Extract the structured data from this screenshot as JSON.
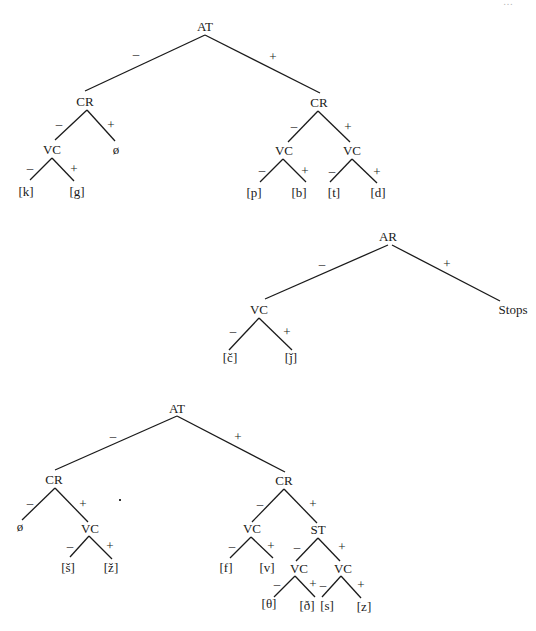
{
  "page_number_fragment": "…",
  "trees": [
    {
      "id": "tree-1",
      "root": {
        "label": "AT",
        "x": 205,
        "y": 31
      },
      "nodes": [
        {
          "id": "t1-at",
          "label": "AT",
          "x": 205,
          "y": 31
        },
        {
          "id": "t1-cr-minus",
          "label": "CR",
          "x": 85,
          "y": 106
        },
        {
          "id": "t1-cr-plus",
          "label": "CR",
          "x": 319,
          "y": 107
        },
        {
          "id": "t1-vc-1",
          "label": "VC",
          "x": 52,
          "y": 154
        },
        {
          "id": "t1-null",
          "label": "ø",
          "x": 116,
          "y": 154
        },
        {
          "id": "t1-k",
          "label": "[k]",
          "x": 26,
          "y": 196
        },
        {
          "id": "t1-g",
          "label": "[g]",
          "x": 77,
          "y": 196
        },
        {
          "id": "t1-vc-2",
          "label": "VC",
          "x": 284,
          "y": 155
        },
        {
          "id": "t1-vc-3",
          "label": "VC",
          "x": 352,
          "y": 155
        },
        {
          "id": "t1-p",
          "label": "[p]",
          "x": 254,
          "y": 197
        },
        {
          "id": "t1-b",
          "label": "[b]",
          "x": 299,
          "y": 197
        },
        {
          "id": "t1-t",
          "label": "[t]",
          "x": 334,
          "y": 197
        },
        {
          "id": "t1-d",
          "label": "[d]",
          "x": 378,
          "y": 197
        }
      ],
      "edges": [
        {
          "x1": 205,
          "y1": 35,
          "x2": 85,
          "y2": 91,
          "sign": "–",
          "sx": 136,
          "sy": 58
        },
        {
          "x1": 205,
          "y1": 35,
          "x2": 320,
          "y2": 93,
          "sign": "+",
          "sx": 273,
          "sy": 61
        },
        {
          "x1": 87,
          "y1": 110,
          "x2": 55,
          "y2": 140,
          "sign": "–",
          "sx": 59,
          "sy": 128
        },
        {
          "x1": 87,
          "y1": 110,
          "x2": 115,
          "y2": 141,
          "sign": "+",
          "sx": 111,
          "sy": 129
        },
        {
          "x1": 52,
          "y1": 158,
          "x2": 30,
          "y2": 180,
          "sign": "–",
          "sx": 30,
          "sy": 172
        },
        {
          "x1": 52,
          "y1": 158,
          "x2": 74,
          "y2": 181,
          "sign": "+",
          "sx": 74,
          "sy": 173
        },
        {
          "x1": 318,
          "y1": 111,
          "x2": 288,
          "y2": 142,
          "sign": "–",
          "sx": 294,
          "sy": 130
        },
        {
          "x1": 318,
          "y1": 111,
          "x2": 350,
          "y2": 142,
          "sign": "+",
          "sx": 348,
          "sy": 131
        },
        {
          "x1": 283,
          "y1": 159,
          "x2": 260,
          "y2": 182,
          "sign": "–",
          "sx": 262,
          "sy": 174
        },
        {
          "x1": 283,
          "y1": 159,
          "x2": 306,
          "y2": 182,
          "sign": "+",
          "sx": 305,
          "sy": 175
        },
        {
          "x1": 352,
          "y1": 159,
          "x2": 330,
          "y2": 182,
          "sign": "–",
          "sx": 332,
          "sy": 175
        },
        {
          "x1": 352,
          "y1": 159,
          "x2": 377,
          "y2": 183,
          "sign": "+",
          "sx": 377,
          "sy": 176
        }
      ]
    },
    {
      "id": "tree-2",
      "nodes": [
        {
          "id": "t2-ar",
          "label": "AR",
          "x": 388,
          "y": 241
        },
        {
          "id": "t2-vc",
          "label": "VC",
          "x": 259,
          "y": 314
        },
        {
          "id": "t2-stops",
          "label": "Stops",
          "x": 513,
          "y": 314
        },
        {
          "id": "t2-c",
          "label": "[č]",
          "x": 230,
          "y": 362
        },
        {
          "id": "t2-j",
          "label": "[ǰ]",
          "x": 291,
          "y": 362
        }
      ],
      "edges": [
        {
          "x1": 388,
          "y1": 245,
          "x2": 265,
          "y2": 299,
          "sign": "–",
          "sx": 322,
          "sy": 268
        },
        {
          "x1": 392,
          "y1": 245,
          "x2": 500,
          "y2": 301,
          "sign": "+",
          "sx": 447,
          "sy": 268
        },
        {
          "x1": 259,
          "y1": 318,
          "x2": 229,
          "y2": 350,
          "sign": "–",
          "sx": 233,
          "sy": 335
        },
        {
          "x1": 259,
          "y1": 318,
          "x2": 292,
          "y2": 350,
          "sign": "+",
          "sx": 287,
          "sy": 336
        }
      ]
    },
    {
      "id": "tree-3",
      "nodes": [
        {
          "id": "t3-at",
          "label": "AT",
          "x": 177,
          "y": 413
        },
        {
          "id": "t3-cr-minus",
          "label": "CR",
          "x": 54,
          "y": 484
        },
        {
          "id": "t3-cr-plus",
          "label": "CR",
          "x": 284,
          "y": 485
        },
        {
          "id": "t3-null",
          "label": "ø",
          "x": 20,
          "y": 531
        },
        {
          "id": "t3-vc-1",
          "label": "VC",
          "x": 90,
          "y": 533
        },
        {
          "id": "t3-sh",
          "label": "[š]",
          "x": 68,
          "y": 572
        },
        {
          "id": "t3-zh",
          "label": "[ž]",
          "x": 111,
          "y": 572
        },
        {
          "id": "t3-vc-2",
          "label": "VC",
          "x": 252,
          "y": 533
        },
        {
          "id": "t3-st",
          "label": "ST",
          "x": 318,
          "y": 534
        },
        {
          "id": "t3-f",
          "label": "[f]",
          "x": 226,
          "y": 572
        },
        {
          "id": "t3-v",
          "label": "[v]",
          "x": 267,
          "y": 572
        },
        {
          "id": "t3-vc-3",
          "label": "VC",
          "x": 299,
          "y": 573
        },
        {
          "id": "t3-vc-4",
          "label": "VC",
          "x": 343,
          "y": 573
        },
        {
          "id": "t3-theta",
          "label": "[θ]",
          "x": 269,
          "y": 608
        },
        {
          "id": "t3-eth",
          "label": "[ð]",
          "x": 307,
          "y": 610
        },
        {
          "id": "t3-s",
          "label": "[s]",
          "x": 327,
          "y": 610
        },
        {
          "id": "t3-z",
          "label": "[z]",
          "x": 364,
          "y": 611
        }
      ],
      "edges": [
        {
          "x1": 177,
          "y1": 416,
          "x2": 55,
          "y2": 470,
          "sign": "–",
          "sx": 113,
          "sy": 440
        },
        {
          "x1": 177,
          "y1": 416,
          "x2": 285,
          "y2": 472,
          "sign": "+",
          "sx": 238,
          "sy": 441
        },
        {
          "x1": 55,
          "y1": 488,
          "x2": 22,
          "y2": 520,
          "sign": "–",
          "sx": 30,
          "sy": 507
        },
        {
          "x1": 55,
          "y1": 488,
          "x2": 88,
          "y2": 522,
          "sign": "+",
          "sx": 83,
          "sy": 508
        },
        {
          "x1": 89,
          "y1": 536,
          "x2": 70,
          "y2": 557,
          "sign": "–",
          "sx": 70,
          "sy": 550
        },
        {
          "x1": 89,
          "y1": 536,
          "x2": 112,
          "y2": 559,
          "sign": "+",
          "sx": 110,
          "sy": 550
        },
        {
          "x1": 284,
          "y1": 489,
          "x2": 252,
          "y2": 522,
          "sign": "–",
          "sx": 260,
          "sy": 508
        },
        {
          "x1": 284,
          "y1": 489,
          "x2": 317,
          "y2": 523,
          "sign": "+",
          "sx": 313,
          "sy": 508
        },
        {
          "x1": 251,
          "y1": 537,
          "x2": 230,
          "y2": 558,
          "sign": "–",
          "sx": 232,
          "sy": 550
        },
        {
          "x1": 251,
          "y1": 537,
          "x2": 273,
          "y2": 558,
          "sign": "+",
          "sx": 271,
          "sy": 550
        },
        {
          "x1": 318,
          "y1": 538,
          "x2": 296,
          "y2": 561,
          "sign": "–",
          "sx": 297,
          "sy": 551
        },
        {
          "x1": 318,
          "y1": 538,
          "x2": 340,
          "y2": 561,
          "sign": "+",
          "sx": 342,
          "sy": 551
        },
        {
          "x1": 295,
          "y1": 576,
          "x2": 274,
          "y2": 597,
          "sign": "–",
          "sx": 277,
          "sy": 588
        },
        {
          "x1": 295,
          "y1": 576,
          "x2": 315,
          "y2": 597,
          "sign": "+",
          "sx": 313,
          "sy": 588
        },
        {
          "x1": 341,
          "y1": 576,
          "x2": 322,
          "y2": 597,
          "sign": "–",
          "sx": 323,
          "sy": 589
        },
        {
          "x1": 341,
          "y1": 576,
          "x2": 361,
          "y2": 598,
          "sign": "+",
          "sx": 361,
          "sy": 589
        }
      ]
    }
  ],
  "stray_mark": {
    "x": 119,
    "y": 499
  }
}
